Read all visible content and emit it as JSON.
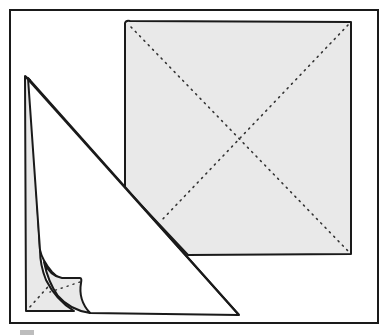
{
  "diagram": {
    "type": "folding-illustration",
    "colors": {
      "stroke": "#1a1a1a",
      "fill_shaded": "#e9e9e9",
      "fill_paper": "#ffffff",
      "background": "#ffffff"
    },
    "frame": {
      "x": 10,
      "y": 10,
      "width": 368,
      "height": 313
    },
    "square": {
      "corners": [
        [
          125,
          21
        ],
        [
          351,
          22
        ],
        [
          351,
          254
        ],
        [
          126,
          254
        ]
      ],
      "diagonals": "dotted"
    },
    "triangle": {
      "apex": [
        25,
        76
      ],
      "bottom_left": [
        26,
        311
      ],
      "bottom_right": [
        239,
        315
      ],
      "curled_corner": true
    }
  }
}
